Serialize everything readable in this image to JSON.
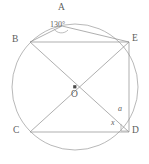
{
  "figure": {
    "type": "circle-geometry-diagram",
    "stroke_color": "#9a9a9a",
    "text_color": "#5d5d5d",
    "background": "#ffffff",
    "circle": {
      "cx": 75,
      "cy": 87,
      "r": 63
    },
    "center_label": "O",
    "points": [
      {
        "name": "A",
        "label": "A",
        "x": 62,
        "y": 26,
        "label_x": 58,
        "label_y": 3
      },
      {
        "name": "B",
        "label": "B",
        "x": 30,
        "y": 42,
        "label_x": 12,
        "label_y": 35
      },
      {
        "name": "C",
        "label": "C",
        "x": 30,
        "y": 132,
        "label_x": 13,
        "label_y": 126
      },
      {
        "name": "D",
        "label": "D",
        "x": 129,
        "y": 132,
        "label_x": 132,
        "label_y": 126
      },
      {
        "name": "E",
        "label": "E",
        "x": 129,
        "y": 42,
        "label_x": 132,
        "label_y": 34
      },
      {
        "name": "O",
        "label": "O",
        "x": 75,
        "y": 87,
        "label_x": 71,
        "label_y": 90
      }
    ],
    "segments": [
      {
        "name": "chord-B-A",
        "from": "B",
        "to": "A"
      },
      {
        "name": "chord-A-E",
        "from": "A",
        "to": "E"
      },
      {
        "name": "chord-B-E",
        "from": "B",
        "to": "E"
      },
      {
        "name": "chord-C-D",
        "from": "C",
        "to": "D"
      },
      {
        "name": "chord-E-D",
        "from": "E",
        "to": "D"
      },
      {
        "name": "diagonal-B-D",
        "from": "B",
        "to": "D"
      },
      {
        "name": "diagonal-C-E",
        "from": "C",
        "to": "E"
      }
    ],
    "angles": [
      {
        "name": "angle-at-A",
        "label": "130°",
        "vertex": "A",
        "label_x": 50,
        "label_y": 21
      },
      {
        "name": "angle-a-at-D",
        "label": "a",
        "vertex": "D",
        "label_x": 118,
        "label_y": 105
      },
      {
        "name": "angle-x-at-D",
        "label": "x",
        "vertex": "D",
        "label_x": 111,
        "label_y": 119
      }
    ],
    "markers": [
      {
        "name": "angle-arc-at-A",
        "type": "arc"
      },
      {
        "name": "right-angle-mark-at-D",
        "type": "square"
      },
      {
        "name": "center-point-dot",
        "type": "dot"
      }
    ]
  }
}
